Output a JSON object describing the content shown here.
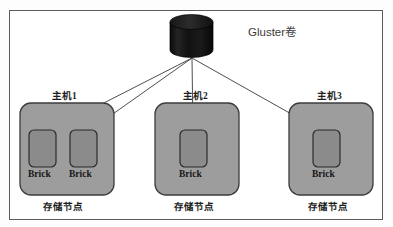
{
  "diagram": {
    "type": "architecture-diagram",
    "title_label": "Gluster卷",
    "volume": {
      "shape": "cylinder",
      "label": "Gluster卷",
      "fill": "#141414",
      "x": 170,
      "y": 15,
      "w": 43,
      "h": 42
    },
    "fan_origin": {
      "x": 192,
      "y": 58
    },
    "colors": {
      "frame_border": "#5b5b5b",
      "host_fill": "#9d9d9d",
      "host_border": "#3c3c3c",
      "brick_fill": "#8b8b8b",
      "brick_border": "#2b2b2b",
      "connector": "#3a3a3a",
      "text": "#1d1d1d",
      "volume_text": "#3a3a3a",
      "background": "#ffffff"
    },
    "hosts": [
      {
        "id": "host-1",
        "title": "主机1",
        "footer": "存储节点",
        "x": 20,
        "y": 103,
        "w": 94,
        "h": 92,
        "title_cx": 67,
        "title_y": 88,
        "footer_cx": 67,
        "footer_y": 199,
        "bricks": [
          {
            "label": "Brick",
            "x": 29,
            "y": 130,
            "w": 26,
            "h": 36,
            "label_cx": 42,
            "label_y": 172
          },
          {
            "label": "Brick",
            "x": 70,
            "y": 130,
            "w": 26,
            "h": 36,
            "label_cx": 83,
            "label_y": 172
          }
        ]
      },
      {
        "id": "host-2",
        "title": "主机2",
        "footer": "存储节点",
        "x": 155,
        "y": 103,
        "w": 84,
        "h": 92,
        "title_cx": 197,
        "title_y": 88,
        "footer_cx": 197,
        "footer_y": 199,
        "bricks": [
          {
            "label": "Brick",
            "x": 180,
            "y": 130,
            "w": 26,
            "h": 36,
            "label_cx": 193,
            "label_y": 172
          }
        ]
      },
      {
        "id": "host-3",
        "title": "主机3",
        "footer": "存储节点",
        "x": 289,
        "y": 103,
        "w": 84,
        "h": 92,
        "title_cx": 331,
        "title_y": 88,
        "footer_cx": 331,
        "footer_y": 199,
        "bricks": [
          {
            "label": "Brick",
            "x": 314,
            "y": 130,
            "w": 26,
            "h": 36,
            "label_cx": 327,
            "label_y": 172
          }
        ]
      }
    ],
    "connectors": [
      {
        "from_host": "host-1",
        "to_brick": 0,
        "x1": 192,
        "y1": 58,
        "x2": 43,
        "y2": 130
      },
      {
        "from_host": "host-1",
        "to_brick": 1,
        "x1": 192,
        "y1": 58,
        "x2": 84,
        "y2": 130
      },
      {
        "from_host": "host-2",
        "to_brick": 0,
        "x1": 192,
        "y1": 58,
        "x2": 193,
        "y2": 130
      },
      {
        "from_host": "host-3",
        "to_brick": 0,
        "x1": 192,
        "y1": 58,
        "x2": 326,
        "y2": 130
      }
    ]
  }
}
